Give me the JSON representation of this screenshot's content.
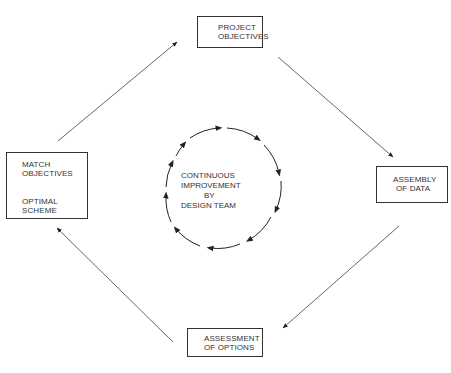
{
  "diagram": {
    "title": "",
    "nodes": {
      "top": {
        "line1": "PROJECT",
        "line2": "OBJECTIVES"
      },
      "right": {
        "line1": "ASSEMBLY",
        "line2": "OF DATA"
      },
      "bottom": {
        "line1": "ASSESSMENT",
        "line2": "OF OPTIONS"
      },
      "left": {
        "line1": "MATCH",
        "line2": "OBJECTIVES",
        "connector": "double-arrow-vertical",
        "line3": "OPTIMAL",
        "line4": "SCHEME"
      }
    },
    "center": {
      "line1": "CONTINUOUS",
      "line2": "IMPROVEMENT",
      "line3": "BY",
      "line4": "DESIGN TEAM",
      "cycle_direction": "clockwise",
      "cycle_arrow_count": 10
    },
    "edges": [
      {
        "from": "left",
        "to": "top"
      },
      {
        "from": "top",
        "to": "right"
      },
      {
        "from": "right",
        "to": "bottom"
      },
      {
        "from": "bottom",
        "to": "left"
      }
    ],
    "colors": {
      "line": "#333333",
      "background": "#ffffff"
    }
  }
}
